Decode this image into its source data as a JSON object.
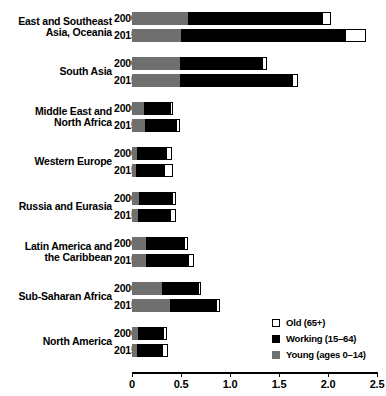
{
  "chart_data": {
    "type": "bar",
    "orientation": "horizontal",
    "stacked": true,
    "title": "",
    "subtitle": "",
    "xlabel": "",
    "ylabel": "",
    "xlim": [
      0,
      2.5
    ],
    "xticks": [
      0,
      0.5,
      1.0,
      1.5,
      2.0,
      2.5
    ],
    "xticklabels": [
      "0",
      "0.5",
      "1.0",
      "1.5",
      "2.0",
      "2.5"
    ],
    "grid": false,
    "legend_position": "bottom-right",
    "legend": [
      {
        "label": "Old (65+)",
        "color": "#ffffff",
        "key": "old"
      },
      {
        "label": "Working (15–64)",
        "color": "#000000",
        "key": "working"
      },
      {
        "label": "Young (ages 0–14)",
        "color": "#6f6f6f",
        "key": "young"
      }
    ],
    "series": [
      {
        "name": "Young (ages 0–14)",
        "key": "young",
        "color": "#6f6f6f"
      },
      {
        "name": "Working (15–64)",
        "key": "working",
        "color": "#000000"
      },
      {
        "name": "Old (65+)",
        "key": "old",
        "color": "#ffffff"
      }
    ],
    "groups": [
      {
        "region": "East and Southeast Asia, Oceania",
        "region_lines": [
          "East and Southeast",
          "Asia, Oceania"
        ],
        "bars": [
          {
            "year": "2000",
            "young": 0.57,
            "working": 1.37,
            "old": 0.09,
            "total": 2.03
          },
          {
            "year": "2015",
            "young": 0.5,
            "working": 1.67,
            "old": 0.22,
            "total": 2.39
          }
        ]
      },
      {
        "region": "South Asia",
        "region_lines": [
          "South Asia"
        ],
        "bars": [
          {
            "year": "2000",
            "young": 0.49,
            "working": 0.84,
            "old": 0.05,
            "total": 1.38
          },
          {
            "year": "2015",
            "young": 0.49,
            "working": 1.14,
            "old": 0.06,
            "total": 1.69
          }
        ]
      },
      {
        "region": "Middle East and North Africa",
        "region_lines": [
          "Middle East and",
          "North Africa"
        ],
        "bars": [
          {
            "year": "2000",
            "young": 0.12,
            "working": 0.27,
            "old": 0.03,
            "total": 0.42
          },
          {
            "year": "2015",
            "young": 0.13,
            "working": 0.32,
            "old": 0.04,
            "total": 0.49
          }
        ]
      },
      {
        "region": "Western Europe",
        "region_lines": [
          "Western Europe"
        ],
        "bars": [
          {
            "year": "2000",
            "young": 0.05,
            "working": 0.3,
            "old": 0.06,
            "total": 0.41
          },
          {
            "year": "2015",
            "young": 0.04,
            "working": 0.29,
            "old": 0.09,
            "total": 0.42
          }
        ]
      },
      {
        "region": "Russia and Eurasia",
        "region_lines": [
          "Russia and Eurasia"
        ],
        "bars": [
          {
            "year": "2000",
            "young": 0.07,
            "working": 0.34,
            "old": 0.04,
            "total": 0.45
          },
          {
            "year": "2015",
            "young": 0.06,
            "working": 0.33,
            "old": 0.06,
            "total": 0.45
          }
        ]
      },
      {
        "region": "Latin America and the Caribbean",
        "region_lines": [
          "Latin America and",
          "the Caribbean"
        ],
        "bars": [
          {
            "year": "2000",
            "young": 0.14,
            "working": 0.39,
            "old": 0.04,
            "total": 0.57
          },
          {
            "year": "2015",
            "young": 0.14,
            "working": 0.43,
            "old": 0.06,
            "total": 0.63
          }
        ]
      },
      {
        "region": "Sub-Saharan Africa",
        "region_lines": [
          "Sub-Saharan Africa"
        ],
        "bars": [
          {
            "year": "2000",
            "young": 0.31,
            "working": 0.36,
            "old": 0.03,
            "total": 0.7
          },
          {
            "year": "2015",
            "young": 0.39,
            "working": 0.47,
            "old": 0.04,
            "total": 0.9
          }
        ]
      },
      {
        "region": "North America",
        "region_lines": [
          "North America"
        ],
        "bars": [
          {
            "year": "2000",
            "young": 0.06,
            "working": 0.26,
            "old": 0.04,
            "total": 0.36
          },
          {
            "year": "2015",
            "young": 0.05,
            "working": 0.26,
            "old": 0.06,
            "total": 0.37
          }
        ]
      }
    ]
  }
}
